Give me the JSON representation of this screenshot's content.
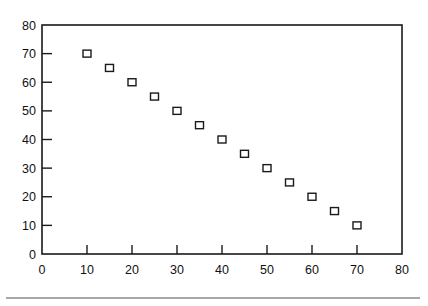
{
  "chart_data": {
    "type": "scatter",
    "title": "",
    "xlabel": "",
    "ylabel": "",
    "xlim": [
      0,
      80
    ],
    "ylim": [
      0,
      80
    ],
    "x_ticks": [
      0,
      10,
      20,
      30,
      40,
      50,
      60,
      70,
      80
    ],
    "y_ticks": [
      0,
      10,
      20,
      30,
      40,
      50,
      60,
      70,
      80
    ],
    "grid": false,
    "legend": null,
    "marker": "open-square",
    "series": [
      {
        "name": "data",
        "x": [
          10,
          15,
          20,
          25,
          30,
          35,
          40,
          45,
          50,
          55,
          60,
          65,
          70
        ],
        "y": [
          70,
          65,
          60,
          55,
          50,
          45,
          40,
          35,
          30,
          25,
          20,
          15,
          10
        ]
      }
    ]
  },
  "colors": {
    "axis": "#1a1a1a",
    "marker_stroke": "#1a1a1a",
    "marker_fill": "#ffffff",
    "rule": "#a8a8a8"
  }
}
